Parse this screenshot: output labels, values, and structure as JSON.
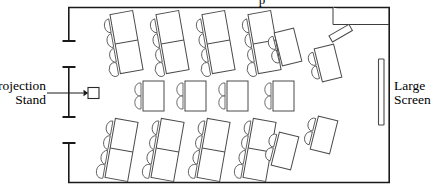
{
  "diagram": {
    "type": "floor-plan",
    "kind": "classroom-seating-layout",
    "top_partial_caption": "p",
    "labels": {
      "projection_stand_line1": "Projection",
      "projection_stand_line2": "Stand",
      "large_screen_line1": "Large",
      "large_screen_line2": "Screen"
    },
    "colors": {
      "wall": "#1a1a1a",
      "furniture_stroke": "#4a4a4a",
      "chair_stroke": "#5a5a5a",
      "background": "#ffffff",
      "text": "#000000"
    },
    "room": {
      "x": 68,
      "y": 7,
      "width": 322,
      "height": 176,
      "left_wall_openings": 2,
      "alcove": {
        "x": 333,
        "y": 7,
        "width": 57,
        "height": 17,
        "position": "top-right"
      }
    },
    "left_wall_segments": [
      {
        "id": "upper",
        "y1": 7,
        "y2": 41,
        "tick_ends": "bottom"
      },
      {
        "id": "middle",
        "y1": 67,
        "y2": 117,
        "tick_ends": "both"
      },
      {
        "id": "lower",
        "y1": 143,
        "y2": 183,
        "tick_ends": "top"
      }
    ],
    "screen": {
      "x": 378,
      "y": 59,
      "width": 6,
      "height": 66,
      "label": "Large Screen"
    },
    "projection_stand": {
      "x": 88,
      "y": 87,
      "size": 11,
      "label": "Projection Stand"
    },
    "furniture_summary": {
      "long_tables_top_row": 4,
      "long_tables_bottom_row": 4,
      "small_tables_middle_row": 4,
      "angled_tables_right": 4,
      "total_tables": 16,
      "chairs_per_long_table": 4,
      "chairs_per_small_table": 2,
      "chairs_per_angled_table": 2,
      "total_chairs": 48
    },
    "rows": [
      {
        "id": "top-row",
        "tilt_deg": -10,
        "tables": [
          {
            "x": 115,
            "y": 12,
            "w": 23,
            "h": 60,
            "split": true,
            "chairs": 4,
            "chair_side": "left"
          },
          {
            "x": 161,
            "y": 12,
            "w": 23,
            "h": 60,
            "split": true,
            "chairs": 4,
            "chair_side": "left"
          },
          {
            "x": 207,
            "y": 12,
            "w": 23,
            "h": 60,
            "split": true,
            "chairs": 4,
            "chair_side": "left"
          },
          {
            "x": 253,
            "y": 12,
            "w": 23,
            "h": 60,
            "split": true,
            "chairs": 4,
            "chair_side": "left"
          }
        ]
      },
      {
        "id": "middle-row",
        "tilt_deg": 0,
        "tables": [
          {
            "x": 143,
            "y": 81,
            "w": 21,
            "h": 30,
            "split": false,
            "chairs": 2,
            "chair_side": "left"
          },
          {
            "x": 185,
            "y": 81,
            "w": 21,
            "h": 30,
            "split": false,
            "chairs": 2,
            "chair_side": "left"
          },
          {
            "x": 227,
            "y": 81,
            "w": 21,
            "h": 30,
            "split": false,
            "chairs": 2,
            "chair_side": "left"
          },
          {
            "x": 273,
            "y": 81,
            "w": 21,
            "h": 30,
            "split": false,
            "chairs": 2,
            "chair_side": "left"
          }
        ]
      },
      {
        "id": "bottom-row",
        "tilt_deg": 10,
        "tables": [
          {
            "x": 110,
            "y": 120,
            "w": 23,
            "h": 60,
            "split": true,
            "chairs": 4,
            "chair_side": "left"
          },
          {
            "x": 156,
            "y": 120,
            "w": 23,
            "h": 60,
            "split": true,
            "chairs": 4,
            "chair_side": "left"
          },
          {
            "x": 202,
            "y": 120,
            "w": 23,
            "h": 60,
            "split": true,
            "chairs": 4,
            "chair_side": "left"
          },
          {
            "x": 248,
            "y": 120,
            "w": 23,
            "h": 60,
            "split": true,
            "chairs": 4,
            "chair_side": "left"
          }
        ]
      },
      {
        "id": "right-cluster",
        "tilt_deg": -14,
        "tables": [
          {
            "x": 278,
            "y": 30,
            "w": 20,
            "h": 34,
            "split": false,
            "chairs": 2,
            "chair_side": "left"
          },
          {
            "x": 318,
            "y": 46,
            "w": 20,
            "h": 34,
            "split": false,
            "chairs": 2,
            "chair_side": "left"
          },
          {
            "x": 275,
            "y": 134,
            "w": 20,
            "h": 34,
            "split": false,
            "chairs": 2,
            "chair_side": "left"
          },
          {
            "x": 314,
            "y": 118,
            "w": 20,
            "h": 34,
            "split": false,
            "chairs": 2,
            "chair_side": "left"
          }
        ],
        "extra_bar": {
          "x": 329,
          "y": 30,
          "w": 23,
          "h": 7,
          "tilt_deg": -30
        }
      }
    ]
  }
}
